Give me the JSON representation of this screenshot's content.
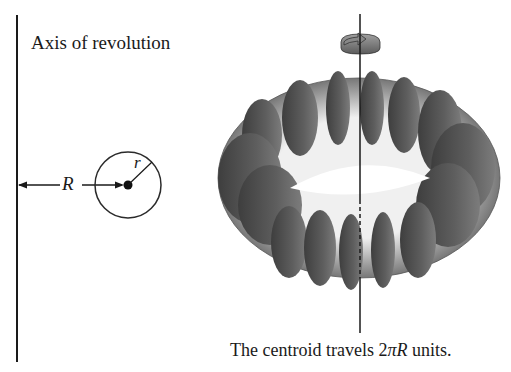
{
  "figure": {
    "axis_label": "Axis of revolution",
    "radius_label_big": "R",
    "radius_label_small": "r",
    "caption": {
      "prefix": "The centroid travels 2",
      "pi": "π",
      "R": "R",
      "suffix": " units."
    },
    "colors": {
      "line": "#1a1a1a",
      "torus_dark": "#4a4a4a",
      "torus_mid": "#8a8a8a",
      "torus_light": "#e6e6e6",
      "arrow_ring": "#7a7a7a"
    }
  }
}
